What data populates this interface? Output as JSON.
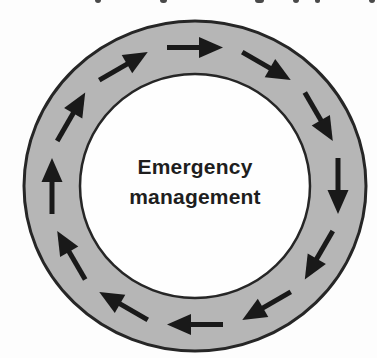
{
  "diagram": {
    "type": "cycle",
    "flow_direction": "clockwise",
    "center_label": {
      "line1": "Emergency",
      "line2": "management"
    },
    "arrow_count": 12,
    "arrow_angles_deg": [
      0,
      30,
      60,
      90,
      120,
      150,
      180,
      210,
      240,
      270,
      300,
      330
    ],
    "colors": {
      "background": "#fdfdfd",
      "ring_fill": "#b6b6b6",
      "ring_stroke": "#262626",
      "inner_fill": "#fefefe",
      "arrow": "#191919",
      "text": "#1e1e1e",
      "caption_fragment": "#4a4a4a"
    },
    "geometry": {
      "cx": 195,
      "cy": 186,
      "outer_rx": 171,
      "outer_ry": 165,
      "inner_rx": 115,
      "inner_ry": 112,
      "outer_stroke_width": 3,
      "inner_stroke_width": 2.5,
      "arrow_length": 56,
      "arrow_head_length": 24,
      "arrow_head_width": 19,
      "arrow_shaft_width": 5
    },
    "cropped_caption_fragments": [
      {
        "x": 95,
        "w": 6
      },
      {
        "x": 160,
        "w": 7
      },
      {
        "x": 255,
        "w": 9
      },
      {
        "x": 293,
        "w": 6
      },
      {
        "x": 315,
        "w": 5
      },
      {
        "x": 369,
        "w": 6
      }
    ]
  }
}
